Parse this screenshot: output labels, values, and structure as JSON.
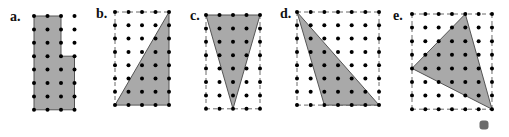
{
  "figure": {
    "panels": [
      {
        "label": "a.",
        "label_pos": [
          10,
          21
        ],
        "grid": {
          "cols": 4,
          "rows": 8,
          "x0": 34,
          "y0": 16,
          "dx": 13.5,
          "dy": 13.4
        },
        "dashed_lines": [],
        "shape": [
          [
            0,
            0
          ],
          [
            2,
            0
          ],
          [
            2,
            3
          ],
          [
            3,
            3
          ],
          [
            3,
            7
          ],
          [
            0,
            7
          ]
        ]
      },
      {
        "label": "b.",
        "label_pos": [
          96,
          18
        ],
        "grid": {
          "cols": 5,
          "rows": 8,
          "x0": 115,
          "y0": 12,
          "dx": 13.5,
          "dy": 13.3
        },
        "dashed_lines": [
          [
            [
              0,
              0
            ],
            [
              4,
              0
            ]
          ],
          [
            [
              0,
              0
            ],
            [
              0,
              7
            ]
          ]
        ],
        "shape": [
          [
            4,
            0
          ],
          [
            0,
            7
          ],
          [
            4,
            7
          ]
        ]
      },
      {
        "label": "c.",
        "label_pos": [
          190,
          20
        ],
        "grid": {
          "cols": 5,
          "rows": 8,
          "x0": 206,
          "y0": 15,
          "dx": 13.5,
          "dy": 13.4
        },
        "dashed_lines": [
          [
            [
              0,
              0
            ],
            [
              0,
              7
            ]
          ],
          [
            [
              4,
              0
            ],
            [
              4,
              7
            ]
          ],
          [
            [
              0,
              7
            ],
            [
              4,
              7
            ]
          ],
          [
            [
              2,
              0
            ],
            [
              2,
              7
            ]
          ]
        ],
        "shape": [
          [
            0,
            0
          ],
          [
            4,
            0
          ],
          [
            2,
            7
          ]
        ]
      },
      {
        "label": "d.",
        "label_pos": [
          280,
          18
        ],
        "grid": {
          "cols": 7,
          "rows": 8,
          "x0": 297,
          "y0": 12,
          "dx": 13.67,
          "dy": 13.3
        },
        "dashed_lines": [
          [
            [
              0,
              0
            ],
            [
              6,
              0
            ]
          ],
          [
            [
              0,
              0
            ],
            [
              0,
              7
            ]
          ],
          [
            [
              6,
              0
            ],
            [
              6,
              7
            ]
          ],
          [
            [
              0,
              7
            ],
            [
              6,
              7
            ]
          ]
        ],
        "shape": [
          [
            0,
            0
          ],
          [
            2,
            7
          ],
          [
            6,
            7
          ]
        ]
      },
      {
        "label": "e.",
        "label_pos": [
          393,
          20
        ],
        "grid": {
          "cols": 7,
          "rows": 8,
          "x0": 412,
          "y0": 14,
          "dx": 13.33,
          "dy": 13.6
        },
        "dashed_lines": [
          [
            [
              0,
              0
            ],
            [
              6,
              0
            ]
          ],
          [
            [
              0,
              0
            ],
            [
              0,
              7
            ]
          ],
          [
            [
              6,
              0
            ],
            [
              6,
              7
            ]
          ],
          [
            [
              0,
              7
            ],
            [
              6,
              7
            ]
          ]
        ],
        "shape": [
          [
            4,
            0
          ],
          [
            0,
            4
          ],
          [
            6,
            7
          ]
        ]
      }
    ],
    "colors": {
      "fill": "#a9a9a9",
      "stroke": "#555555",
      "dot": "#000000",
      "dash": "#444444",
      "marker": "#6b6b6b"
    },
    "marker": {
      "x": 484,
      "y": 125,
      "size": 9
    }
  }
}
